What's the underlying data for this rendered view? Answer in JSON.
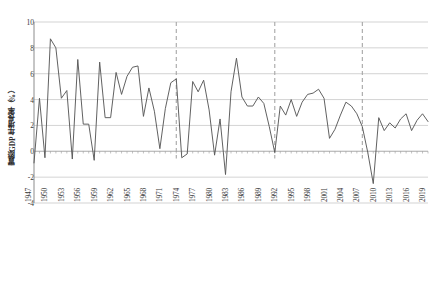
{
  "chart_data": {
    "type": "line",
    "title": "",
    "subtitle": "",
    "xlabel": "",
    "ylabel": "實際GDP年增長率（%）",
    "ylim": [
      -4,
      10
    ],
    "xlim": [
      1947,
      2019
    ],
    "ytick_values": [
      10,
      8,
      6,
      4,
      2,
      0,
      -2,
      -4
    ],
    "ytick_labels": [
      "10",
      "8",
      "6",
      "4",
      "2",
      "0",
      "-2",
      "-4"
    ],
    "xtick_labels": [
      "1947",
      "1950",
      "1953",
      "1956",
      "1959",
      "1962",
      "1965",
      "1968",
      "1971",
      "1974",
      "1977",
      "1980",
      "1983",
      "1986",
      "1989",
      "1992",
      "1995",
      "1998",
      "2001",
      "2004",
      "2007",
      "2010",
      "2013",
      "2016",
      "2019"
    ],
    "xtick_values": [
      1947,
      1950,
      1953,
      1956,
      1959,
      1962,
      1965,
      1968,
      1971,
      1974,
      1977,
      1980,
      1983,
      1986,
      1989,
      1992,
      1995,
      1998,
      2001,
      2004,
      2007,
      2010,
      2013,
      2016,
      2019
    ],
    "grid": "horizontal",
    "legend": "none",
    "line_color": "#595959",
    "grid_color": "#c8c8c8",
    "marker_line_color": "#a6a6a6",
    "background": "#ffffff",
    "vertical_markers": [
      1973,
      1991,
      2007
    ],
    "x": [
      1947,
      1948,
      1949,
      1950,
      1951,
      1952,
      1953,
      1954,
      1955,
      1956,
      1957,
      1958,
      1959,
      1960,
      1961,
      1962,
      1963,
      1964,
      1965,
      1966,
      1967,
      1968,
      1969,
      1970,
      1971,
      1972,
      1973,
      1974,
      1975,
      1976,
      1977,
      1978,
      1979,
      1980,
      1981,
      1982,
      1983,
      1984,
      1985,
      1986,
      1987,
      1988,
      1989,
      1990,
      1991,
      1992,
      1993,
      1994,
      1995,
      1996,
      1997,
      1998,
      1999,
      2000,
      2001,
      2002,
      2003,
      2004,
      2005,
      2006,
      2007,
      2008,
      2009,
      2010,
      2011,
      2012,
      2013,
      2014,
      2015,
      2016,
      2017,
      2018,
      2019
    ],
    "values": [
      -0.9,
      4.1,
      -0.5,
      8.7,
      8.0,
      4.1,
      4.7,
      -0.6,
      7.1,
      2.1,
      2.1,
      -0.7,
      6.9,
      2.6,
      2.6,
      6.1,
      4.4,
      5.8,
      6.5,
      6.6,
      2.7,
      4.9,
      3.1,
      0.2,
      3.3,
      5.3,
      5.6,
      -0.5,
      -0.2,
      5.4,
      4.6,
      5.5,
      3.2,
      -0.3,
      2.5,
      -1.8,
      4.6,
      7.2,
      4.2,
      3.5,
      3.5,
      4.2,
      3.7,
      1.9,
      -0.1,
      3.5,
      2.8,
      4.0,
      2.7,
      3.8,
      4.4,
      4.5,
      4.8,
      4.1,
      1.0,
      1.7,
      2.8,
      3.8,
      3.5,
      2.9,
      1.9,
      -0.1,
      -2.5,
      2.6,
      1.6,
      2.2,
      1.8,
      2.5,
      2.9,
      1.6,
      2.4,
      2.9,
      2.3
    ],
    "series_name": "實際GDP年增長率"
  }
}
